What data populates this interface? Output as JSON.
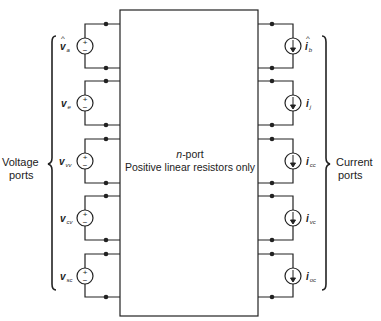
{
  "figure": {
    "nport_box": {
      "title": "n-port",
      "title_italic_part": "n",
      "title_rest": "-port",
      "subtitle": "Positive linear resistors only"
    },
    "left_group": {
      "label_line1": "Voltage",
      "label_line2": "ports",
      "sources": [
        {
          "type": "voltage-source",
          "symbol": "v",
          "subscript": "a",
          "hat": true,
          "plus": "+",
          "minus": "−"
        },
        {
          "type": "voltage-source",
          "symbol": "v",
          "subscript": "e",
          "hat": false,
          "plus": "+",
          "minus": "−"
        },
        {
          "type": "voltage-source",
          "symbol": "v",
          "subscript": "vv",
          "hat": false,
          "plus": "+",
          "minus": "−"
        },
        {
          "type": "voltage-source",
          "symbol": "v",
          "subscript": "cv",
          "hat": false,
          "plus": "+",
          "minus": "−"
        },
        {
          "type": "voltage-source",
          "symbol": "v",
          "subscript": "sc",
          "hat": false,
          "plus": "+",
          "minus": "−"
        }
      ]
    },
    "right_group": {
      "label_line1": "Current",
      "label_line2": "ports",
      "sources": [
        {
          "type": "current-source",
          "symbol": "i",
          "subscript": "b",
          "hat": true
        },
        {
          "type": "current-source",
          "symbol": "i",
          "subscript": "j",
          "hat": false
        },
        {
          "type": "current-source",
          "symbol": "i",
          "subscript": "cc",
          "hat": false
        },
        {
          "type": "current-source",
          "symbol": "i",
          "subscript": "vc",
          "hat": false
        },
        {
          "type": "current-source",
          "symbol": "i",
          "subscript": "oc",
          "hat": false
        }
      ]
    },
    "colors": {
      "line": "#222222",
      "background": "#ffffff"
    }
  }
}
